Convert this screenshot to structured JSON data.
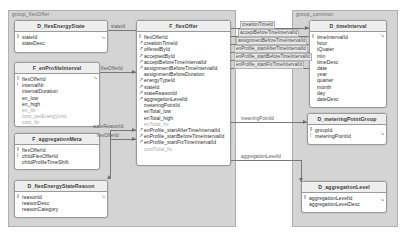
{
  "diagram": {
    "groups": [
      {
        "id": "group-flexoffer",
        "label": "group_flexOffer"
      },
      {
        "id": "group-common",
        "label": "group_common"
      }
    ],
    "entities": [
      {
        "id": "d-flexenergystate",
        "title": "D_flexEnergyState",
        "attributes": [
          {
            "name": "stateId",
            "key": "pk",
            "dim": false
          },
          {
            "name": "stateDesc",
            "key": "none",
            "dim": false
          }
        ]
      },
      {
        "id": "f-enprofileinterval",
        "title": "F_enProfileInterval",
        "attributes": [
          {
            "name": "flexOfferId",
            "key": "pk",
            "dim": false
          },
          {
            "name": "intervalNr",
            "key": "fk",
            "dim": false
          },
          {
            "name": "intervalDuration",
            "key": "none",
            "dim": false
          },
          {
            "name": "en_low",
            "key": "none",
            "dim": false
          },
          {
            "name": "en_high",
            "key": "none",
            "dim": false
          },
          {
            "name": "en_fix",
            "key": "none",
            "dim": true
          },
          {
            "name": "cost_perEnergyUnit",
            "key": "none",
            "dim": true
          },
          {
            "name": "cost_fix",
            "key": "none",
            "dim": true
          }
        ]
      },
      {
        "id": "f-aggregationmeta",
        "title": "F_aggregationMeta",
        "attributes": [
          {
            "name": "flexOfferId",
            "key": "pk",
            "dim": false
          },
          {
            "name": "childFlexOfferId",
            "key": "fk",
            "dim": false
          },
          {
            "name": "childProfileTimeShift",
            "key": "none",
            "dim": false
          }
        ]
      },
      {
        "id": "d-flexenergystatereason",
        "title": "D_flexEnergyStateReason",
        "attributes": [
          {
            "name": "reasonId",
            "key": "pk",
            "dim": false
          },
          {
            "name": "reasonDesc",
            "key": "none",
            "dim": false
          },
          {
            "name": "reasonCategory",
            "key": "none",
            "dim": false
          }
        ]
      },
      {
        "id": "f-flexoffer",
        "title": "F_flexOffer",
        "attributes": [
          {
            "name": "flexOfferId",
            "key": "pk",
            "dim": false
          },
          {
            "name": "creationTimeId",
            "key": "fk",
            "dim": false
          },
          {
            "name": "offeredById",
            "key": "fk",
            "dim": false
          },
          {
            "name": "acceptedById",
            "key": "fk",
            "dim": false
          },
          {
            "name": "acceptBeforeTimeIntervalId",
            "key": "fk",
            "dim": false
          },
          {
            "name": "assignmentBeforeTimeIntervalId",
            "key": "fk",
            "dim": false
          },
          {
            "name": "assignmentBeforeDuration",
            "key": "none",
            "dim": false
          },
          {
            "name": "energyTypeId",
            "key": "fk",
            "dim": false
          },
          {
            "name": "stateId",
            "key": "fk",
            "dim": false
          },
          {
            "name": "stateReasonId",
            "key": "fk",
            "dim": false
          },
          {
            "name": "aggregationLevelId",
            "key": "fk",
            "dim": false
          },
          {
            "name": "meteringPointId",
            "key": "none",
            "dim": false
          },
          {
            "name": "enTotal_low",
            "key": "none",
            "dim": false
          },
          {
            "name": "enTotal_high",
            "key": "none",
            "dim": false
          },
          {
            "name": "enTotal_fix",
            "key": "none",
            "dim": true
          },
          {
            "name": "enProfile_startAfterTimeIntervalId",
            "key": "fk",
            "dim": false
          },
          {
            "name": "enProfile_startBeforeTimeIntervalId",
            "key": "fk",
            "dim": false
          },
          {
            "name": "enProfile_startFixTimeIntervalId",
            "key": "fk",
            "dim": false
          },
          {
            "name": "costTotal_fix",
            "key": "none",
            "dim": true
          }
        ]
      },
      {
        "id": "d-timeinterval",
        "title": "D_timeInterval",
        "attributes": [
          {
            "name": "timeIntervalId",
            "key": "pk",
            "dim": false
          },
          {
            "name": "hour",
            "key": "none",
            "dim": false
          },
          {
            "name": "tQuater",
            "key": "none",
            "dim": false
          },
          {
            "name": "min",
            "key": "none",
            "dim": false
          },
          {
            "name": "timeDesc",
            "key": "none",
            "dim": false
          },
          {
            "name": "date",
            "key": "none",
            "dim": false
          },
          {
            "name": "year",
            "key": "none",
            "dim": false
          },
          {
            "name": "quarter",
            "key": "none",
            "dim": false
          },
          {
            "name": "month",
            "key": "none",
            "dim": false
          },
          {
            "name": "day",
            "key": "none",
            "dim": false
          },
          {
            "name": "dateDesc",
            "key": "none",
            "dim": false
          }
        ]
      },
      {
        "id": "d-meteringpointgroup",
        "title": "D_meteringPointGroup",
        "attributes": [
          {
            "name": "groupId",
            "key": "pk",
            "dim": false
          },
          {
            "name": "meteringPointId",
            "key": "fk",
            "dim": false
          }
        ]
      },
      {
        "id": "d-aggregationlevel",
        "title": "D_aggregationLevel",
        "attributes": [
          {
            "name": "aggregationLevelId",
            "key": "pk",
            "dim": false
          },
          {
            "name": "aggregationLevelDesc",
            "key": "none",
            "dim": false
          }
        ]
      }
    ],
    "edge_labels": [
      {
        "id": "lbl-stateid",
        "text": "stateId"
      },
      {
        "id": "lbl-flexofferid-enprofile",
        "text": "flexOfferId"
      },
      {
        "id": "lbl-statereasonid",
        "text": "stateReasonId"
      },
      {
        "id": "lbl-flexofferid-agg",
        "text": "flexOfferId"
      },
      {
        "id": "lbl-creationtimeid",
        "text": "creationTimeId"
      },
      {
        "id": "lbl-acceptbefore",
        "text": "acceptBeforeTimeIntervalId"
      },
      {
        "id": "lbl-assignmentbefore",
        "text": "assignmentBeforeTimeIntervalId"
      },
      {
        "id": "lbl-startafter",
        "text": "enProfile_startAfterTimeIntervalId"
      },
      {
        "id": "lbl-startbefore",
        "text": "enProfile_startBeforeTimeIntervalId"
      },
      {
        "id": "lbl-startfix",
        "text": "enProfile_startFixTimeIntervalId"
      },
      {
        "id": "lbl-meteringpointid",
        "text": "meteringPointId"
      },
      {
        "id": "lbl-aggregationlevelid",
        "text": "aggregationLevelId"
      }
    ],
    "key_glyphs": {
      "pk": "२",
      "fk": "↗",
      "none": " "
    },
    "colors": {
      "group_bg": "#d4d4d4",
      "entity_bg": "#ffffff",
      "entity_header_bg": "#eeeeee",
      "border": "#9a9a9a",
      "edge": "#777777",
      "text": "#2b2b2b",
      "dim_text": "#a8a8a8"
    }
  }
}
